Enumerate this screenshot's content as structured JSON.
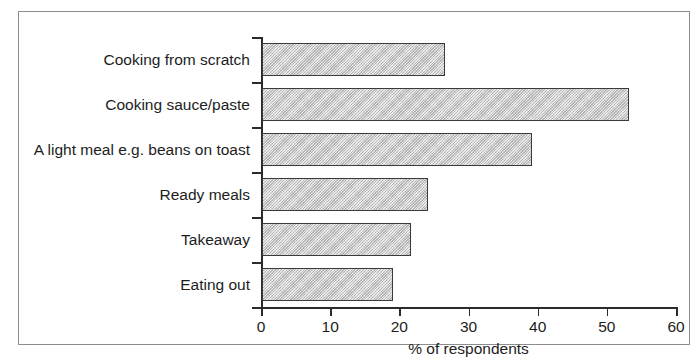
{
  "chart_data": {
    "type": "bar",
    "orientation": "horizontal",
    "title": "",
    "xlabel": "% of respondents",
    "ylabel": "",
    "xlim": [
      0,
      60
    ],
    "xticks": [
      "0",
      "10",
      "20",
      "30",
      "40",
      "50",
      "60"
    ],
    "grid": false,
    "legend": false,
    "categories": [
      "Cooking from scratch",
      "Cooking sauce/paste",
      "A light meal e.g. beans on toast",
      "Ready meals",
      "Takeaway",
      "Eating out"
    ],
    "values": [
      26.5,
      53,
      39,
      24,
      21.5,
      19
    ],
    "bar_fill_color": "#c9c9c9",
    "bar_edge_color": "#3a3a3a",
    "axis_color": "#2b2b2b",
    "frame_color": "#8d8d8d"
  }
}
